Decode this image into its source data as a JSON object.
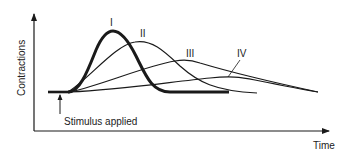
{
  "diagram": {
    "y_axis_label": "Contractions",
    "x_axis_label": "Time",
    "stimulus_label": "Stimulus applied",
    "curves": [
      {
        "name": "I",
        "label": "I",
        "style": "thick"
      },
      {
        "name": "II",
        "label": "II",
        "style": "thin"
      },
      {
        "name": "III",
        "label": "III",
        "style": "thin"
      },
      {
        "name": "IV",
        "label": "IV",
        "style": "thin"
      }
    ],
    "colors": {
      "line": "#1a1a1a",
      "background": "#ffffff"
    }
  }
}
